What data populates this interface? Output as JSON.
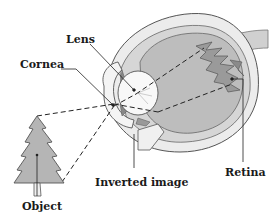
{
  "figure": {
    "labels": {
      "lens": "Lens",
      "cornea": "Cornea",
      "retina": "Retina",
      "inverted_image": "Inverted image",
      "object": "Object"
    }
  },
  "colors": {
    "background": "#ffffff",
    "eye_outline": "#555555",
    "vitreous": "#bdbdbd",
    "sclera": "#e8e8e8",
    "tree_fill": "#b5b5b5",
    "retina_image": "#9a9a9a",
    "label_text": "#1a1a1a"
  }
}
